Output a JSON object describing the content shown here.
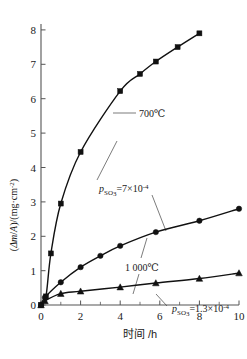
{
  "chart_data": {
    "type": "line",
    "title": "",
    "xlabel": "时间 /h",
    "ylabel": "(Δm/A)/(mg·cm⁻²)",
    "xlim": [
      0,
      10.6
    ],
    "ylim": [
      0,
      8.3
    ],
    "xticks": [
      0,
      2,
      4,
      6,
      8,
      10
    ],
    "xtick_labels": [
      "0",
      "2",
      "4",
      "6",
      "8",
      "10"
    ],
    "xminor_step": 0.5,
    "yticks": [
      0,
      1,
      2,
      3,
      4,
      5,
      6,
      7,
      8
    ],
    "ytick_labels": [
      "0",
      "1",
      "2",
      "3",
      "4",
      "5",
      "6",
      "7",
      "8"
    ],
    "grid": false,
    "legend": "none",
    "series": [
      {
        "name": "700℃, p_SO3 = 7×10⁻⁴",
        "marker": "square",
        "x": [
          0,
          0.25,
          0.5,
          1.0,
          2.0,
          4.0,
          5.0,
          5.8,
          6.9,
          8.0
        ],
        "values": [
          0.0,
          0.25,
          1.5,
          2.95,
          4.45,
          6.22,
          6.72,
          7.08,
          7.5,
          7.9
        ]
      },
      {
        "name": "1 000℃, p_SO3 = 7×10⁻⁴",
        "marker": "circle",
        "x": [
          0,
          0.2,
          1.0,
          2.0,
          3.0,
          4.0,
          5.8,
          8.0,
          10.0
        ],
        "values": [
          0.0,
          0.22,
          0.66,
          1.1,
          1.43,
          1.72,
          2.12,
          2.45,
          2.8
        ]
      },
      {
        "name": "1 000℃, p_SO3 = 1.3×10⁻⁴",
        "marker": "triangle",
        "x": [
          0,
          0.2,
          1.0,
          2.0,
          4.0,
          5.8,
          8.0,
          10.0
        ],
        "values": [
          0.0,
          0.12,
          0.33,
          0.4,
          0.52,
          0.64,
          0.77,
          0.93
        ]
      }
    ],
    "annotations": [
      {
        "id": "temp-700",
        "text": "700℃",
        "x_px": 139,
        "y_px": 116
      },
      {
        "id": "pso3-7e-4",
        "text_main": "=7×10",
        "text_var": "p",
        "text_sub": "SO",
        "text_sub2": "3",
        "text_sup": "-4",
        "x_px": 99,
        "y_px": 190
      },
      {
        "id": "temp-1000",
        "text": "1 000℃",
        "x_px": 125,
        "y_px": 268
      },
      {
        "id": "pso3-13e-4",
        "text_main": "=1.3×10",
        "text_var": "p",
        "text_sub": "SO",
        "text_sub2": "3",
        "text_sup": "-4",
        "x_px": 169,
        "y_px": 310
      }
    ]
  },
  "axis": {
    "y_label_parts": {
      "open": "(",
      "delta": "Δ",
      "m": "m",
      "slash1": "/",
      "A": "A",
      "close_slash": ")/(",
      "unit": "mg·cm",
      "exp": "-2",
      "end": ")"
    },
    "x_label": "时间 /h"
  },
  "colors": {
    "axis": "#555555",
    "curve": "#111111",
    "marker": "#111111",
    "leader": "#444444",
    "background": "#ffffff",
    "text": "#1a1a1a"
  }
}
